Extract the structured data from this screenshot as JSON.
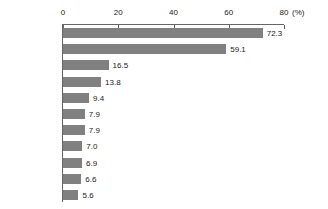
{
  "chart_data": {
    "type": "bar",
    "orientation": "horizontal",
    "title": "",
    "xlabel": "(%)",
    "ylabel": "",
    "xlim": [
      0,
      80
    ],
    "xticks": [
      0,
      20,
      40,
      60,
      80
    ],
    "xtick_labels": [
      "0",
      "20",
      "40",
      "60",
      "80"
    ],
    "unit_label": "(%)",
    "grid": false,
    "legend": false,
    "axis_position": "top",
    "bar_color": "#808080",
    "categories": [
      "日本",
      "韓国",
      "フィンランド",
      "カナダ",
      "シンガポール",
      "アメリカ",
      "ドイツ",
      "イタリア",
      "イギリス",
      "台湾",
      "フランス"
    ],
    "values": [
      72.3,
      59.1,
      16.5,
      13.8,
      9.4,
      7.9,
      7.9,
      7.0,
      6.9,
      6.6,
      5.6
    ],
    "value_labels": [
      "72.3",
      "59.1",
      "16.5",
      "13.8",
      "9.4",
      "7.9",
      "7.9",
      "7.0",
      "6.9",
      "6.6",
      "5.6"
    ]
  }
}
